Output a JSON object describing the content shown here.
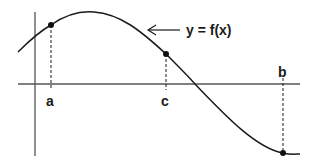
{
  "diagram": {
    "curve_label": "y = f(x)",
    "points": [
      {
        "label": "a",
        "x": 51,
        "y": 25
      },
      {
        "label": "c",
        "x": 166,
        "y": 54
      },
      {
        "label": "b",
        "x": 283,
        "y": 153
      }
    ],
    "colors": {
      "stroke": "#1a1a1a",
      "axis": "#555555",
      "background": "#ffffff"
    }
  }
}
